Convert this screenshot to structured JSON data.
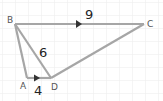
{
  "diagram": {
    "type": "geometry",
    "background": "#ffffff",
    "grid_color": "#ebebeb",
    "line_color": "#a6a6a6",
    "arrow_color": "#333333",
    "vertices": {
      "B": {
        "label": "B",
        "x": 15,
        "y": 24
      },
      "C": {
        "label": "C",
        "x": 144,
        "y": 24
      },
      "A": {
        "label": "A",
        "x": 27,
        "y": 78
      },
      "D": {
        "label": "D",
        "x": 51,
        "y": 78
      }
    },
    "segments": [
      {
        "from": "B",
        "to": "C",
        "parallel_mark": true
      },
      {
        "from": "A",
        "to": "D",
        "parallel_mark": true
      },
      {
        "from": "B",
        "to": "A"
      },
      {
        "from": "B",
        "to": "D"
      },
      {
        "from": "D",
        "to": "C"
      }
    ],
    "measurements": {
      "BC": "9",
      "BD": "6",
      "AD": "4"
    }
  }
}
